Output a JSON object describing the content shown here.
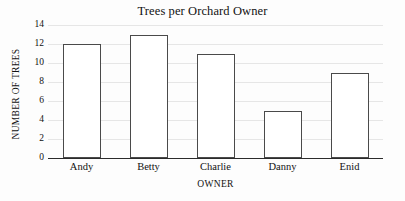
{
  "chart_data": {
    "type": "bar",
    "title": "Trees per Orchard Owner",
    "xlabel": "OWNER",
    "ylabel": "NUMBER OF TREES",
    "categories": [
      "Andy",
      "Betty",
      "Charlie",
      "Danny",
      "Enid"
    ],
    "values": [
      12,
      13,
      11,
      5,
      9
    ],
    "ylim": [
      0,
      14
    ],
    "yticks": [
      0,
      2,
      4,
      6,
      8,
      10,
      12,
      14
    ],
    "ytick_labels": [
      "0",
      "2",
      "4",
      "6",
      "8",
      "10",
      "12",
      "14"
    ],
    "grid": true,
    "grid_axis": "y",
    "legend": false,
    "legend_position": "none",
    "bar_fill_color": "#ffffff",
    "bar_edge_color": "#4a4a4a",
    "gridline_color": "#e6e6e6",
    "axis_color": "#2b2b2b",
    "background_color": "#fdfdfd",
    "text_color": "#111111"
  }
}
